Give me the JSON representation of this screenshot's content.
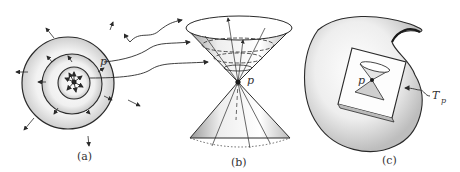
{
  "figure": {
    "panels": [
      {
        "id": "a",
        "caption": "(a)",
        "point_label": "p",
        "description": "concentric wavefronts expanding from point p with outward arrows"
      },
      {
        "id": "b",
        "caption": "(b)",
        "point_label": "p",
        "description": "double light cone with vertex at p"
      },
      {
        "id": "c",
        "caption": "(c)",
        "point_label": "p",
        "tangent_label": "T",
        "tangent_subscript": "p",
        "description": "curved manifold with tangent plane containing a light cone at p"
      }
    ],
    "colors": {
      "ink": "#2a2a2a",
      "stipple": "#8a8a8a",
      "background": "#ffffff"
    }
  }
}
